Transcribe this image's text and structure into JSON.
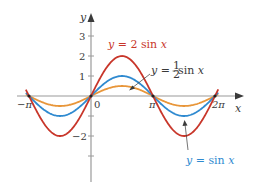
{
  "chart_data": {
    "type": "line",
    "title": "",
    "xlabel": "x",
    "ylabel": "y",
    "xlim": [
      -3.4,
      7.1
    ],
    "ylim": [
      -3.5,
      3.5
    ],
    "grid": false,
    "legend": "none (curves labeled by annotations)",
    "x_ticks": [
      {
        "value": -3.14159,
        "label": "−π"
      },
      {
        "value": 0,
        "label": "0"
      },
      {
        "value": 3.14159,
        "label": "π"
      },
      {
        "value": 6.28319,
        "label": "2π"
      }
    ],
    "y_ticks": [
      {
        "value": 3,
        "label": "3"
      },
      {
        "value": 2,
        "label": "2"
      },
      {
        "value": 1,
        "label": "1"
      },
      {
        "value": -1,
        "label": ""
      },
      {
        "value": -2,
        "label": "−2"
      },
      {
        "value": -3,
        "label": ""
      }
    ],
    "x_range": [
      -3.3,
      6.45
    ],
    "series": [
      {
        "name": "y = 2 sin x",
        "amplitude": 2,
        "color": "#c8362a",
        "x": [
          -3.1416,
          -1.5708,
          0,
          1.5708,
          3.1416,
          4.7124,
          6.2832
        ],
        "values": [
          0,
          -2,
          0,
          2,
          0,
          -2,
          0
        ]
      },
      {
        "name": "y = sin x",
        "amplitude": 1,
        "color": "#2f8ad0",
        "x": [
          -3.1416,
          -1.5708,
          0,
          1.5708,
          3.1416,
          4.7124,
          6.2832
        ],
        "values": [
          0,
          -1,
          0,
          1,
          0,
          -1,
          0
        ]
      },
      {
        "name": "y = ½ sin x",
        "amplitude": 0.5,
        "color": "#e8963a",
        "x": [
          -3.1416,
          -1.5708,
          0,
          1.5708,
          3.1416,
          4.7124,
          6.2832
        ],
        "values": [
          0,
          -0.5,
          0,
          0.5,
          0,
          -0.5,
          0
        ]
      }
    ],
    "annotations": [
      {
        "text": "y = 2 sin x",
        "color": "#c8362a",
        "points_to": "y = 2 sin x"
      },
      {
        "text": "y = ½ sin x",
        "color": "#3a3a3a",
        "points_to": "y = ½ sin x"
      },
      {
        "text": "y = sin x",
        "color": "#2f8ad0",
        "points_to": "y = sin x"
      }
    ]
  },
  "labels": {
    "x_axis": "x",
    "y_axis": "y",
    "tick_3": "3",
    "tick_2": "2",
    "tick_1": "1",
    "tick_neg2": "−2",
    "tick_origin": "0",
    "tick_neg_pi": "−π",
    "tick_pi": "π",
    "tick_2pi": "2π",
    "anno_2sin_prefix": "y",
    "anno_2sin_rest": " = 2 sin ",
    "anno_2sin_x": "x",
    "anno_half_prefix": "y",
    "anno_half_eq": " = ",
    "anno_half_num": "1",
    "anno_half_den": "2",
    "anno_half_rest": " sin ",
    "anno_half_x": "x",
    "anno_sin_prefix": "y",
    "anno_sin_rest": " = sin ",
    "anno_sin_x": "x"
  },
  "colors": {
    "axis": "#8a8a8a",
    "red": "#c8362a",
    "blue": "#2f8ad0",
    "orange": "#e8963a",
    "annotation_dark": "#3a3a3a"
  }
}
